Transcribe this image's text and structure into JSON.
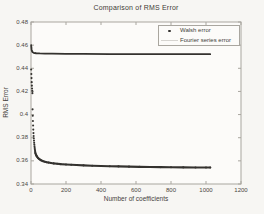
{
  "figure": {
    "title": "Comparison of RMS Error",
    "xlabel": "Number of coefficients",
    "ylabel": "RMS Error",
    "x_tick_labels": [
      "0",
      "200",
      "400",
      "600",
      "800",
      "1000",
      "1200"
    ],
    "y_tick_labels": [
      "0.34",
      "0.36",
      "0.38",
      "0.4",
      "0.42",
      "0.44",
      "0.46",
      "0.48"
    ],
    "frame_color": "#a9a69f",
    "background_color": "#f7f6f3",
    "plot_background_color": "#fcfbf9"
  },
  "legend": {
    "position": "top-right",
    "items": [
      {
        "label": "Walsh error",
        "marker": "dot",
        "color": "#34322f"
      },
      {
        "label": "Fourier series error",
        "marker": "line",
        "color": "#d6d4d0"
      }
    ]
  },
  "chart_data": {
    "type": "scatter",
    "title": "Comparison of RMS Error",
    "xlabel": "Number of coefficients",
    "ylabel": "RMS Error",
    "xlim": [
      0,
      1200
    ],
    "ylim": [
      0.34,
      0.48
    ],
    "x_ticks": [
      0,
      200,
      400,
      600,
      800,
      1000,
      1200
    ],
    "y_ticks": [
      0.34,
      0.36,
      0.38,
      0.4,
      0.42,
      0.44,
      0.46,
      0.48
    ],
    "grid": false,
    "legend_position": "top-right",
    "series": [
      {
        "name": "Walsh error",
        "style": "dots",
        "color": "#34322f",
        "marker_radius": 1.05,
        "line_from_x": 25,
        "points": [
          [
            1,
            0.439
          ],
          [
            2,
            0.435
          ],
          [
            3,
            0.4315
          ],
          [
            4,
            0.428
          ],
          [
            5,
            0.425
          ],
          [
            6,
            0.4225
          ],
          [
            7,
            0.4205
          ],
          [
            8,
            0.4185
          ],
          [
            9,
            0.4045
          ],
          [
            10,
            0.399
          ],
          [
            11,
            0.3945
          ],
          [
            12,
            0.3905
          ],
          [
            13,
            0.387
          ],
          [
            14,
            0.384
          ],
          [
            15,
            0.3815
          ],
          [
            16,
            0.3795
          ],
          [
            17,
            0.3775
          ],
          [
            18,
            0.3757
          ],
          [
            19,
            0.3741
          ],
          [
            20,
            0.3726
          ],
          [
            21,
            0.3712
          ],
          [
            22,
            0.37
          ],
          [
            23,
            0.3688
          ],
          [
            24,
            0.3678
          ],
          [
            25,
            0.3668
          ],
          [
            28,
            0.3655
          ],
          [
            31,
            0.3645
          ],
          [
            35,
            0.3635
          ],
          [
            40,
            0.3625
          ],
          [
            45,
            0.3618
          ],
          [
            50,
            0.3612
          ],
          [
            60,
            0.3603
          ],
          [
            70,
            0.3597
          ],
          [
            80,
            0.3592
          ],
          [
            90,
            0.3588
          ],
          [
            100,
            0.3585
          ],
          [
            115,
            0.3581
          ],
          [
            130,
            0.3578
          ],
          [
            150,
            0.3575
          ],
          [
            170,
            0.3572
          ],
          [
            200,
            0.3569
          ],
          [
            230,
            0.3566
          ],
          [
            260,
            0.3564
          ],
          [
            300,
            0.3561
          ],
          [
            350,
            0.3558
          ],
          [
            400,
            0.3556
          ],
          [
            450,
            0.3554
          ],
          [
            500,
            0.3552
          ],
          [
            560,
            0.355
          ],
          [
            620,
            0.3548
          ],
          [
            680,
            0.3547
          ],
          [
            740,
            0.3546
          ],
          [
            800,
            0.3545
          ],
          [
            870,
            0.3544
          ],
          [
            940,
            0.3543
          ],
          [
            1000,
            0.3542
          ],
          [
            1024,
            0.3542
          ]
        ]
      },
      {
        "name": "Fourier series error",
        "style": "line",
        "color": "#34322f",
        "line_width": 1.8,
        "points": [
          [
            1,
            0.46
          ],
          [
            2,
            0.458
          ],
          [
            3,
            0.4565
          ],
          [
            4,
            0.4555
          ],
          [
            5,
            0.455
          ],
          [
            7,
            0.4543
          ],
          [
            10,
            0.4538
          ],
          [
            15,
            0.4534
          ],
          [
            20,
            0.4532
          ],
          [
            30,
            0.453
          ],
          [
            50,
            0.4528
          ],
          [
            80,
            0.4527
          ],
          [
            120,
            0.4526
          ],
          [
            200,
            0.4525
          ],
          [
            300,
            0.4524
          ],
          [
            450,
            0.4523
          ],
          [
            600,
            0.4523
          ],
          [
            800,
            0.4522
          ],
          [
            1024,
            0.4522
          ]
        ]
      }
    ]
  }
}
